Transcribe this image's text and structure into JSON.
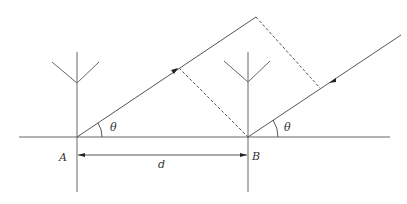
{
  "diagram": {
    "type": "antenna-interferometer-geometry",
    "colors": {
      "line": "#555555",
      "dashed": "#555555",
      "text": "#333333",
      "background": "#ffffff"
    },
    "labels": {
      "antenna_a": "A",
      "antenna_b": "B",
      "baseline": "d",
      "angle_a": "θ",
      "angle_b": "θ"
    },
    "nodes": [
      {
        "id": "A",
        "label": "A",
        "x": 77,
        "y": 137
      },
      {
        "id": "B",
        "label": "B",
        "x": 248,
        "y": 137
      }
    ],
    "edges": [
      {
        "from": "A",
        "to": "B",
        "label": "d",
        "style": "double-arrow dimension"
      },
      {
        "from": "A",
        "to": "upper-left ray end",
        "label": "",
        "style": "solid arrow (upward)"
      },
      {
        "from": "far source",
        "to": "B",
        "label": "",
        "style": "solid arrow (downward)"
      },
      {
        "from": "ray end A",
        "to": "ray B",
        "label": "",
        "style": "dashed perpendicular"
      },
      {
        "from": "ray A",
        "to": "B",
        "label": "",
        "style": "dashed perpendicular"
      }
    ]
  }
}
